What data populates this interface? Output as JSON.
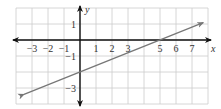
{
  "chart_data": {
    "type": "line",
    "title": "",
    "xlabel": "x",
    "ylabel": "y",
    "xlim": [
      -4,
      8
    ],
    "ylim": [
      -4,
      2
    ],
    "grid": true,
    "x_tick_labels": [
      "−3",
      "−2",
      "−1",
      "1",
      "2",
      "3",
      "5",
      "6",
      "7"
    ],
    "x_tick_values": [
      -3,
      -2,
      -1,
      1,
      2,
      3,
      5,
      6,
      7
    ],
    "y_tick_labels": [
      "1",
      "−1",
      "−3"
    ],
    "y_tick_values": [
      1,
      -1,
      -3
    ],
    "series": [
      {
        "name": "line",
        "equation": "y = 0.4x − 2",
        "slope": 0.4,
        "intercept": -2,
        "x_intercept": 5,
        "points": [
          [
            -3.5,
            -3.4
          ],
          [
            0,
            -2
          ],
          [
            5,
            0
          ],
          [
            7.7,
            1.08
          ]
        ],
        "color": "#777777",
        "arrows": "both"
      }
    ],
    "colors": {
      "grid": "#cccccc",
      "axes": "#111111",
      "line": "#777777"
    }
  }
}
